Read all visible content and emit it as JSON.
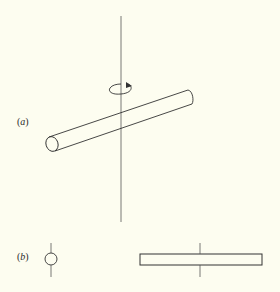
{
  "figure": {
    "background": "#fdfdf0",
    "stroke_color": "#333333",
    "panels": [
      {
        "id": "a",
        "label": "a",
        "description": "Rod (cylinder) inclined with respect to a vertical rotation axis, with rotation arrow around the axis",
        "elements": [
          "vertical-axis",
          "rotation-arrow",
          "inclined-cylinder"
        ]
      },
      {
        "id": "b",
        "label": "b",
        "description": "Two views: end-on circle with axis, and side view rectangle with axis through center",
        "elements": [
          "circle-end-view",
          "rectangle-side-view"
        ]
      }
    ]
  }
}
